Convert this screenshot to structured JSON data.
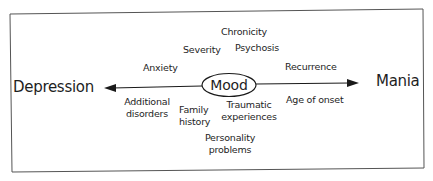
{
  "diagram": {
    "axis": {
      "left_label": "Depression",
      "right_label": "Mania",
      "center_label": "Mood"
    },
    "factors": {
      "chronicity": "Chronicity",
      "severity": "Severity",
      "psychosis": "Psychosis",
      "anxiety": "Anxiety",
      "recurrence": "Recurrence",
      "additional_disorders": [
        "Additional",
        "disorders"
      ],
      "family_history": [
        "Family",
        "history"
      ],
      "traumatic_experiences": [
        "Traumatic",
        "experiences"
      ],
      "age_of_onset": "Age of onset",
      "personality_problems": [
        "Personality",
        "problems"
      ]
    },
    "colors": {
      "line": "#1a1a1a",
      "frame": "#555555",
      "background": "#ffffff"
    }
  }
}
